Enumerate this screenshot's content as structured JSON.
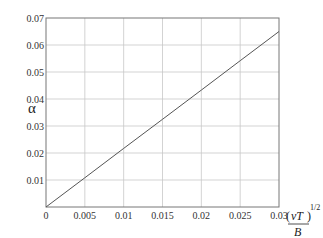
{
  "chart_data": {
    "type": "line",
    "title": "",
    "xlabel": "(νT/B)^1/2",
    "ylabel": "α",
    "xlim": [
      0,
      0.03
    ],
    "ylim": [
      0,
      0.07
    ],
    "grid": true,
    "x_ticks": [
      "0",
      "0.005",
      "0.01",
      "0.015",
      "0.02",
      "0.025",
      "0.03"
    ],
    "y_ticks": [
      "0.01",
      "0.02",
      "0.03",
      "0.04",
      "0.05",
      "0.06",
      "0.07"
    ],
    "series": [
      {
        "name": "alpha",
        "x": [
          0,
          0.005,
          0.01,
          0.015,
          0.02,
          0.025,
          0.03
        ],
        "y": [
          0,
          0.0108,
          0.0217,
          0.0325,
          0.0433,
          0.0542,
          0.065
        ]
      }
    ],
    "colors": {
      "line": "#555555",
      "grid": "#c8c8c8",
      "axis": "#777777"
    }
  },
  "labels": {
    "ylabel": "α",
    "xlabel_num_open": "(",
    "xlabel_num": "νT",
    "xlabel_num_close": ")",
    "xlabel_den": "B",
    "xlabel_exp": "1/2"
  }
}
